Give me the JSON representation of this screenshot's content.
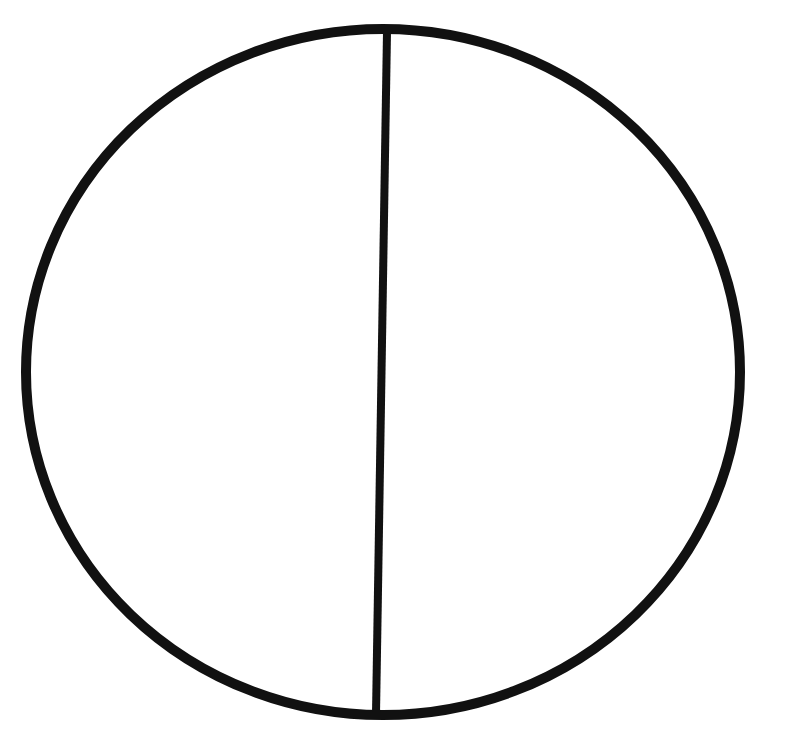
{
  "diagram": {
    "type": "circle-with-chord",
    "colors": {
      "background": "#ffffff",
      "stroke": "#111111"
    },
    "circle": {
      "cx": 383,
      "cy": 372,
      "rx": 357,
      "ry": 343,
      "stroke_width": 10
    },
    "chord": {
      "x1": 387,
      "y1": 32,
      "x2": 376,
      "y2": 714,
      "stroke_width": 8
    }
  }
}
